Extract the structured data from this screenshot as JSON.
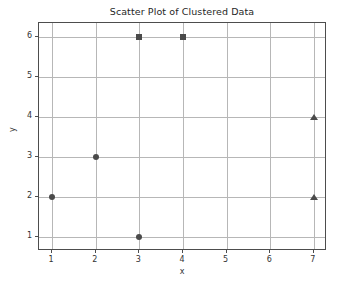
{
  "chart_data": {
    "type": "scatter",
    "title": "Scatter Plot of Clustered Data",
    "xlabel": "x",
    "ylabel": "y",
    "xlim": [
      0.7,
      7.3
    ],
    "ylim": [
      0.65,
      6.35
    ],
    "xticks": [
      1,
      2,
      3,
      4,
      5,
      6,
      7
    ],
    "yticks": [
      1,
      2,
      3,
      4,
      5,
      6
    ],
    "grid": true,
    "legend": null,
    "marker_color": "#4a4a4a",
    "grid_color": "#b7b7b7",
    "axes_color": "#4d4d4d",
    "background": "#ffffff",
    "series": [
      {
        "name": "cluster-1",
        "marker": "circle",
        "color": "#4a4a4a",
        "points": [
          {
            "x": 1,
            "y": 2
          },
          {
            "x": 2,
            "y": 3
          },
          {
            "x": 3,
            "y": 1
          }
        ]
      },
      {
        "name": "cluster-2",
        "marker": "square",
        "color": "#4a4a4a",
        "points": [
          {
            "x": 3,
            "y": 6
          },
          {
            "x": 4,
            "y": 6
          }
        ]
      },
      {
        "name": "cluster-3",
        "marker": "triangle",
        "color": "#4a4a4a",
        "points": [
          {
            "x": 7,
            "y": 4
          },
          {
            "x": 7,
            "y": 2
          }
        ]
      }
    ]
  }
}
